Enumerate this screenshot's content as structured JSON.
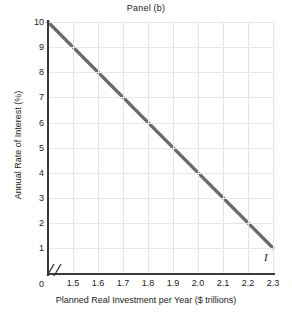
{
  "chart_data": {
    "type": "line",
    "title": "Panel (b)",
    "xlabel": "Planned Real Investment per Year ($ trillions)",
    "ylabel": "Annual Rate of Interest (%)",
    "xlim": [
      1.4,
      2.45
    ],
    "ylim": [
      0,
      10.4
    ],
    "grid": true,
    "legend": "none",
    "axis_break": true,
    "origin_label": "0",
    "xticks": [
      "1.5",
      "1.6",
      "1.7",
      "1.8",
      "1.9",
      "2.0",
      "2.1",
      "2.2",
      "2.3",
      "2.4"
    ],
    "xtick_values": [
      1.5,
      1.6,
      1.7,
      1.8,
      1.9,
      2.0,
      2.1,
      2.2,
      2.3,
      2.4
    ],
    "yticks": [
      "0",
      "1",
      "2",
      "3",
      "4",
      "5",
      "6",
      "7",
      "8",
      "9",
      "10"
    ],
    "ytick_values": [
      0,
      1,
      2,
      3,
      4,
      5,
      6,
      7,
      8,
      9,
      10
    ],
    "series": [
      {
        "name": "I",
        "annotation": "I",
        "color": "#6b6b6b",
        "x": [
          1.5,
          2.4
        ],
        "y": [
          10,
          1
        ],
        "points": [
          {
            "x": 1.5,
            "y": 10
          },
          {
            "x": 1.6,
            "y": 9
          },
          {
            "x": 1.7,
            "y": 8
          },
          {
            "x": 1.8,
            "y": 7
          },
          {
            "x": 1.9,
            "y": 6
          },
          {
            "x": 2.0,
            "y": 5
          },
          {
            "x": 2.1,
            "y": 4
          },
          {
            "x": 2.2,
            "y": 3
          },
          {
            "x": 2.3,
            "y": 2
          },
          {
            "x": 2.4,
            "y": 1
          }
        ]
      }
    ],
    "colors": {
      "line": "#6b6b6b",
      "axis": "#3a3a3a",
      "grid_vertical": "#e3e3e6",
      "grid_horizontal": "#e8e8ea",
      "text": "#222222",
      "background": "#ffffff"
    }
  }
}
